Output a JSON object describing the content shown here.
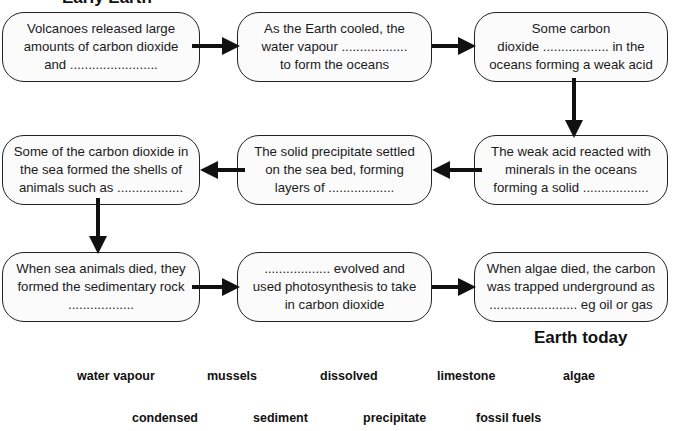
{
  "headings": {
    "start": "Early Earth",
    "end": "Earth today"
  },
  "boxes": [
    {
      "text": "Volcanoes released large\namounts of carbon dioxide\nand ........................"
    },
    {
      "text": "As the Earth cooled, the\nwater vapour ..................\nto form the oceans"
    },
    {
      "text": "Some carbon\ndioxide .................. in the\noceans forming a weak acid"
    },
    {
      "text": "The weak acid reacted with\nminerals in the oceans\nforming a solid .................."
    },
    {
      "text": "The solid precipitate settled\non the sea bed, forming\nlayers of .................."
    },
    {
      "text": "Some of the carbon dioxide in\nthe sea formed the shells of\nanimals such as .................."
    },
    {
      "text": "When sea animals died, they\nformed the sedimentary rock\n.................."
    },
    {
      "text": ".................. evolved and\nused photosynthesis to take\nin carbon dioxide"
    },
    {
      "text": "When algae died, the carbon\nwas trapped underground as\n........................  eg oil or gas"
    }
  ],
  "word_bank": {
    "row1": [
      "water vapour",
      "mussels",
      "dissolved",
      "limestone",
      "algae"
    ],
    "row2": [
      "condensed",
      "sediment",
      "precipitate",
      "fossil fuels"
    ]
  },
  "colors": {
    "stroke": "#222222",
    "box_fill": "#fbfbfb",
    "arrow": "#111111"
  }
}
